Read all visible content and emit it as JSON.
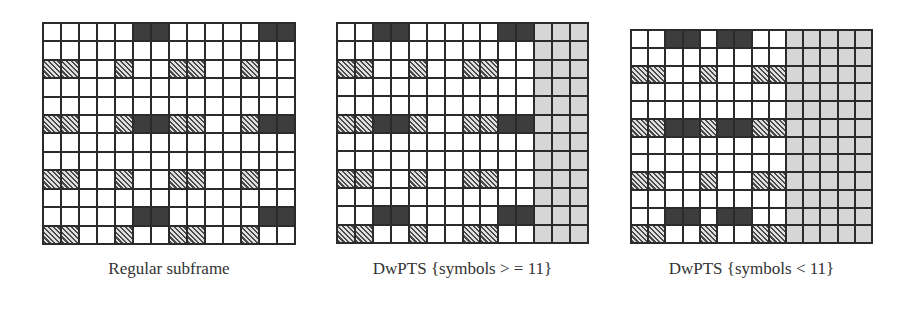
{
  "figure": {
    "panels": [
      {
        "caption": "Regular subframe",
        "columns": 14,
        "rows": 12,
        "gray_columns_from": null,
        "cells": [
          "WWWWWDDWWWWWDD",
          "WWWWWWWWWWWWWW",
          "HHWWHWWHHWWHWW",
          "WWWWWWWWWWWWWW",
          "WWWWWWWWWWWWWW",
          "HHWWHDDHHWWHDD",
          "WWWWWWWWWWWWWW",
          "WWWWWWWWWWWWWW",
          "HHWWHWWHHWWHWW",
          "WWWWWWWWWWWWWW",
          "WWWWWDDWWWWWDD",
          "HHWWHWWHHWWHWW"
        ]
      },
      {
        "caption": "DwPTS {symbols > = 11}",
        "columns": 14,
        "rows": 12,
        "gray_columns_from": 11,
        "cells": [
          "WWDDWWWWWDDGGG",
          "WWWWWWWWWWWGGG",
          "HHWWHWWHHWWGGG",
          "WWWWWWWWWWWGGG",
          "WWWWWWWWWWWGGG",
          "HHDDHWWHHDDGGG",
          "WWWWWWWWWWWGGG",
          "WWWWWWWWWWWGGG",
          "HHWWHWWHHWWGGG",
          "WWWWWWWWWWWGGG",
          "WWDDWWWWWDDGGG",
          "HHWWHWWHHWWGGG"
        ]
      },
      {
        "caption": "DwPTS {symbols < 11}",
        "columns": 14,
        "rows": 12,
        "gray_columns_from": 9,
        "cells": [
          "WWDDWDDWWGGGGG",
          "WWWWWWWWWGGGGG",
          "HHWWHWWHHGGGGG",
          "WWWWWWWWWGGGGG",
          "WWWWWWWWWGGGGG",
          "HHDDHDDHHGGGGG",
          "WWWWWWWWWGGGGG",
          "WWWWWWWWWGGGGG",
          "HHWWHWWHHGGGGG",
          "WWWWWWWWWGGGGG",
          "WWDDWDDWWGGGGG",
          "HHWWHWWHHGGGGG"
        ]
      }
    ],
    "legend_codes": {
      "W": "empty resource element",
      "D": "dark resource element",
      "H": "hatched resource element",
      "G": "gray (unused) resource element"
    },
    "colors": {
      "grid_line": "#2b2b2b",
      "dark": "#3d3d3d",
      "gray": "#d6d6d6",
      "empty": "#ffffff"
    }
  }
}
